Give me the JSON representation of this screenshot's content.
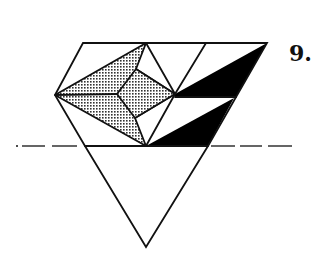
{
  "figure": {
    "step_label": "9.",
    "colors": {
      "line": "#111111",
      "fill_black": "#000000",
      "dot_pattern": "#333333",
      "background": "#ffffff"
    },
    "shapes": {
      "outline": "83,43 267,43 208,146 146,247 85,146 55,95",
      "shaded_region": "55,95 146,43 136,69 175,94 135,118 146,146",
      "inner_kite": "136,69 175,94 135,118 117,94",
      "black_upper": "175,94 267,43 236,97 175,97",
      "black_lower": "146,146 234,98 208,146"
    },
    "fold_line": {
      "y": 146,
      "style": "dash-dot"
    }
  }
}
